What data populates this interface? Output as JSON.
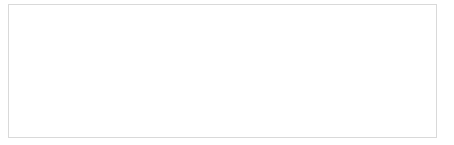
{
  "chart_data": {
    "type": "line",
    "title": "",
    "subtitle": "",
    "xlabel": "",
    "ylabel": "",
    "xlim": [
      -20,
      620
    ],
    "ylim": [
      0,
      700
    ],
    "xticks": [
      -20,
      20,
      60,
      100,
      140,
      180,
      220,
      260,
      300,
      340,
      380,
      420,
      460,
      500,
      540,
      580,
      620
    ],
    "yticks": [
      0,
      100,
      200,
      300,
      400,
      500,
      600,
      700
    ],
    "xtick_labels": [
      "-20",
      "20",
      "60",
      "100",
      "140",
      "180",
      "220",
      "260",
      "300",
      "340",
      "380",
      "420",
      "460",
      "500",
      "540",
      "580",
      "620"
    ],
    "ytick_labels": [
      "0",
      "100",
      "200",
      "300",
      "400",
      "500",
      "600",
      "700"
    ],
    "grid": false,
    "legend": null,
    "legend_position": "none",
    "series": [
      {
        "name": "series-1",
        "color": "#9a9a9a",
        "x": [
          0,
          8,
          16,
          24,
          32,
          40,
          48,
          56,
          64,
          72,
          80,
          90,
          100,
          110,
          120,
          130,
          140,
          150,
          160,
          170,
          180,
          190,
          200,
          210,
          215,
          220,
          228,
          236,
          244,
          252,
          260,
          268,
          276,
          284,
          292,
          300,
          310,
          320,
          330,
          340,
          350,
          360,
          370,
          378,
          385,
          390,
          392,
          396,
          400,
          404,
          410,
          420,
          430,
          440,
          450,
          460,
          470,
          480,
          490,
          496,
          500,
          506,
          512,
          518,
          524,
          530,
          540,
          550,
          560,
          570,
          580,
          590,
          596,
          600
        ],
        "y": [
          640,
          641,
          643,
          648,
          658,
          660,
          659,
          651,
          648,
          646,
          645,
          637,
          630,
          624,
          620,
          612,
          606,
          598,
          592,
          586,
          578,
          570,
          562,
          556,
          552,
          508,
          504,
          500,
          488,
          470,
          452,
          440,
          428,
          412,
          400,
          392,
          382,
          370,
          360,
          352,
          344,
          336,
          326,
          318,
          180,
          176,
          174,
          172,
          208,
          206,
          204,
          200,
          196,
          192,
          188,
          184,
          178,
          170,
          162,
          152,
          140,
          132,
          128,
          124,
          150,
          146,
          134,
          126,
          120,
          112,
          104,
          92,
          82,
          76
        ]
      }
    ]
  }
}
